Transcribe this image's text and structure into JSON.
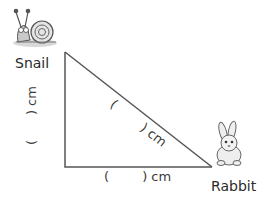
{
  "diagram": {
    "type": "right-triangle",
    "vertices": {
      "top": {
        "x": 65,
        "y": 52,
        "label": "Snail"
      },
      "right_angle": {
        "x": 65,
        "y": 167
      },
      "right": {
        "x": 212,
        "y": 167,
        "label": "Rabbit"
      }
    },
    "characters": {
      "snail": {
        "name": "Snail",
        "icon": "snail-icon"
      },
      "rabbit": {
        "name": "Rabbit",
        "icon": "rabbit-icon"
      }
    },
    "sides": {
      "vertical": {
        "label": "(      ) cm"
      },
      "horizontal": {
        "label": "(        ) cm"
      },
      "hypotenuse": {
        "label": "(        ) cm"
      }
    },
    "colors": {
      "line": "#555555",
      "text": "#333333"
    }
  }
}
